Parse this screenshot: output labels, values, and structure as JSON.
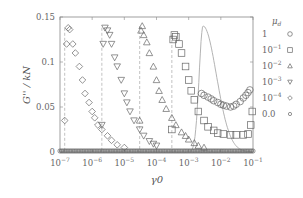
{
  "chart_data": {
    "type": "scatter",
    "title": "",
    "xlabel": "γ0",
    "ylabel": "G'' / kN",
    "xscale": "log",
    "xlim": [
      1e-07,
      0.1
    ],
    "ylim": [
      0,
      0.15
    ],
    "x_ticks": [
      "10^-7",
      "10^-6",
      "10^-5",
      "10^-4",
      "10^-3",
      "10^-2",
      "10^-1"
    ],
    "y_ticks": [
      "0",
      "0.05",
      "0.1",
      "0.15"
    ],
    "grid": false,
    "legend_position": "right-outside",
    "legend_title": "μd",
    "series": [
      {
        "name": "1",
        "marker": "circle",
        "x": [
          0.0025,
          0.003,
          0.004,
          0.005,
          0.006,
          0.008,
          0.01,
          0.012,
          0.015,
          0.02,
          0.025,
          0.03,
          0.04,
          0.05,
          0.06,
          0.07,
          0.08
        ],
        "y": [
          0.065,
          0.063,
          0.061,
          0.059,
          0.057,
          0.055,
          0.053,
          0.052,
          0.051,
          0.05,
          0.051,
          0.053,
          0.056,
          0.06,
          0.063,
          0.066,
          0.069
        ]
      },
      {
        "name": "10^-1",
        "marker": "square",
        "x": [
          0.0003,
          0.00033,
          0.00036,
          0.0004,
          0.0005,
          0.0006,
          0.0008,
          0.001,
          0.0012,
          0.0015,
          0.002,
          0.003,
          0.004,
          0.006,
          0.008,
          0.012,
          0.02,
          0.03,
          0.05,
          0.07,
          0.085,
          0.095
        ],
        "y": [
          0.025,
          0.125,
          0.13,
          0.128,
          0.12,
          0.11,
          0.095,
          0.08,
          0.068,
          0.058,
          0.045,
          0.035,
          0.028,
          0.024,
          0.021,
          0.02,
          0.019,
          0.019,
          0.019,
          0.02,
          0.03,
          0.045
        ]
      },
      {
        "name": "10^-2",
        "marker": "triangle-up",
        "x": [
          3e-05,
          3.3e-05,
          3.6e-05,
          4e-05,
          5e-05,
          6e-05,
          8e-05,
          0.0001,
          0.00012,
          0.00015,
          0.0002,
          0.0003,
          0.0004,
          0.0006,
          0.0008,
          0.001,
          0.0015,
          0.002,
          0.003
        ],
        "y": [
          0.035,
          0.135,
          0.14,
          0.13,
          0.122,
          0.11,
          0.095,
          0.08,
          0.068,
          0.058,
          0.048,
          0.038,
          0.03,
          0.022,
          0.018,
          0.014,
          0.01,
          0.007,
          0.005
        ]
      },
      {
        "name": "10^-3",
        "marker": "triangle-down",
        "x": [
          2e-06,
          2.2e-06,
          2.5e-06,
          3e-06,
          3.5e-06,
          4e-06,
          5e-06,
          6e-06,
          8e-06,
          1e-05,
          1.2e-05,
          1.5e-05,
          2e-05,
          3e-05,
          4e-05,
          6e-05,
          8e-05,
          0.0001
        ],
        "y": [
          0.03,
          0.12,
          0.138,
          0.135,
          0.13,
          0.12,
          0.105,
          0.095,
          0.08,
          0.065,
          0.055,
          0.045,
          0.035,
          0.025,
          0.018,
          0.012,
          0.009,
          0.007
        ]
      },
      {
        "name": "10^-4",
        "marker": "diamond",
        "x": [
          1.4e-07,
          1.6e-07,
          1.8e-07,
          2e-07,
          2.5e-07,
          3e-07,
          4e-07,
          5e-07,
          6e-07,
          8e-07,
          1e-06,
          1.2e-06,
          1.5e-06,
          2e-06,
          3e-06,
          4e-06,
          6e-06,
          1e-05
        ],
        "y": [
          0.035,
          0.12,
          0.138,
          0.136,
          0.12,
          0.11,
          0.095,
          0.08,
          0.065,
          0.055,
          0.045,
          0.038,
          0.03,
          0.025,
          0.018,
          0.013,
          0.008,
          0.005
        ]
      },
      {
        "name": "0.0",
        "marker": "small-circle",
        "x": [
          1e-07,
          1e-06,
          1e-05,
          0.0001,
          0.001,
          0.01,
          0.1
        ],
        "y": [
          0,
          0,
          0,
          0,
          0,
          0,
          0
        ]
      }
    ],
    "reference_curve": {
      "style": "solid-thin-gray",
      "peak_x": 0.0028,
      "peak_y": 0.14
    }
  }
}
